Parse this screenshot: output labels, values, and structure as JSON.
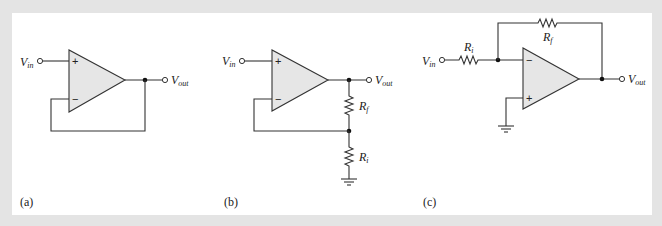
{
  "figure": {
    "background_color": "#e4e4e4",
    "panel_color": "#ffffff",
    "opamp_fill": "#e6e6e6",
    "line_color": "#333333"
  },
  "circuits": [
    {
      "caption": "(a)",
      "name": "voltage follower",
      "input_label": "V",
      "input_sub": "in",
      "output_label": "V",
      "output_sub": "out",
      "plus": "+",
      "minus": "−"
    },
    {
      "caption": "(b)",
      "name": "noninverting amplifier",
      "input_label": "V",
      "input_sub": "in",
      "output_label": "V",
      "output_sub": "out",
      "plus": "+",
      "minus": "−",
      "rf_label": "R",
      "rf_sub": "f",
      "ri_label": "R",
      "ri_sub": "i"
    },
    {
      "caption": "(c)",
      "name": "inverting amplifier",
      "input_label": "V",
      "input_sub": "in",
      "output_label": "V",
      "output_sub": "out",
      "plus": "+",
      "minus": "−",
      "rf_label": "R",
      "rf_sub": "f",
      "ri_label": "R",
      "ri_sub": "i"
    }
  ]
}
